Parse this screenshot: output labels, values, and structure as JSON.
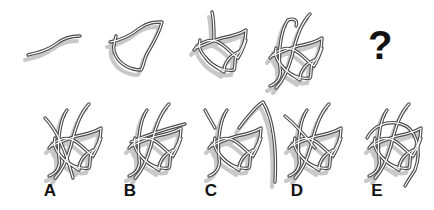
{
  "puzzle": {
    "type": "visual sequence - progressive tangled line figure",
    "question_mark": "?",
    "sequence": [
      {
        "id": "step-1",
        "description": "single wavy stroke"
      },
      {
        "id": "step-2",
        "description": "closed leaf-like loop with crossing"
      },
      {
        "id": "step-3",
        "description": "loop with additional leaf lobes"
      },
      {
        "id": "step-4",
        "description": "leaf knot with added long hooked strokes"
      },
      {
        "id": "step-5",
        "description": "unknown"
      }
    ],
    "options": [
      {
        "label": "A"
      },
      {
        "label": "B"
      },
      {
        "label": "C"
      },
      {
        "label": "D"
      },
      {
        "label": "E"
      }
    ],
    "colors": {
      "stroke": "#4a4a4a",
      "shadow": "#c8c8c8",
      "background": "#ffffff",
      "text": "#111111"
    }
  }
}
